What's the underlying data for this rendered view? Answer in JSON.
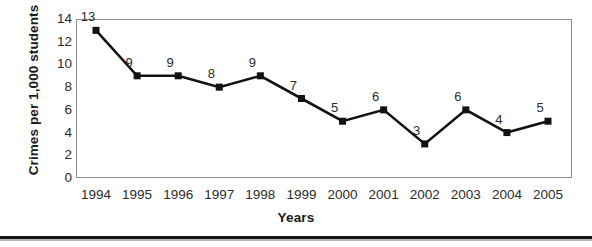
{
  "chart_data": {
    "type": "line",
    "title": "",
    "subtitle": "",
    "xlabel": "Years",
    "ylabel": "Crimes per 1,000 students",
    "categories": [
      "1994",
      "1995",
      "1996",
      "1997",
      "1998",
      "1999",
      "2000",
      "2001",
      "2002",
      "2003",
      "2004",
      "2005"
    ],
    "values": [
      13,
      9,
      9,
      8,
      9,
      7,
      5,
      6,
      3,
      6,
      4,
      5
    ],
    "point_labels": [
      "13",
      "9",
      "9",
      "8",
      "9",
      "7",
      "5",
      "6",
      "3",
      "6",
      "4",
      "5"
    ],
    "series": [
      {
        "name": "Crimes per 1,000 students",
        "values": [
          13,
          9,
          9,
          8,
          9,
          7,
          5,
          6,
          3,
          6,
          4,
          5
        ]
      }
    ],
    "ylim": [
      0,
      14
    ],
    "yticks": [
      0,
      2,
      4,
      6,
      8,
      10,
      12,
      14
    ],
    "ytick_labels": [
      "0",
      "2",
      "4",
      "6",
      "8",
      "10",
      "12",
      "14"
    ],
    "xlim": [
      "1994",
      "2005"
    ],
    "grid": false,
    "legend": false,
    "legend_position": "none",
    "line_color": "#111111",
    "marker_color": "#111111",
    "marker_shape": "square",
    "plot_background": "#ffffff",
    "frame_color": "#8c8c8c",
    "data_labels_shown": true
  },
  "axes": {
    "y_title": "Crimes per 1,000 students",
    "x_title": "Years"
  }
}
